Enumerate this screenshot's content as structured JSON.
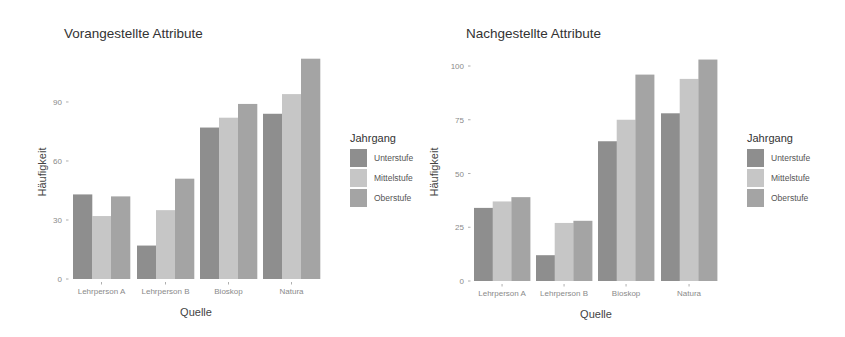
{
  "chart_data": [
    {
      "type": "bar",
      "title": "Vorangestellte Attribute",
      "xlabel": "Quelle",
      "ylabel": "Häufigkeit",
      "categories": [
        "Lehrperson A",
        "Lehrperson B",
        "Bioskop",
        "Natura"
      ],
      "series": [
        {
          "name": "Unterstufe",
          "values": [
            43,
            17,
            77,
            84
          ]
        },
        {
          "name": "Mittelstufe",
          "values": [
            32,
            35,
            82,
            94
          ]
        },
        {
          "name": "Oberstufe",
          "values": [
            42,
            51,
            89,
            112
          ]
        }
      ],
      "yticks": [
        0,
        30,
        60,
        90
      ],
      "ylim": [
        0,
        115
      ],
      "legend": {
        "title": "Jahrgang",
        "position": "right"
      },
      "grid": false
    },
    {
      "type": "bar",
      "title": "Nachgestellte Attribute",
      "xlabel": "Quelle",
      "ylabel": "Häufigkeit",
      "categories": [
        "Lehrperson A",
        "Lehrperson B",
        "Bioskop",
        "Natura"
      ],
      "series": [
        {
          "name": "Unterstufe",
          "values": [
            34,
            12,
            65,
            78
          ]
        },
        {
          "name": "Mittelstufe",
          "values": [
            37,
            27,
            75,
            94
          ]
        },
        {
          "name": "Oberstufe",
          "values": [
            39,
            28,
            96,
            103
          ]
        }
      ],
      "yticks": [
        0,
        25,
        50,
        75,
        100
      ],
      "ylim": [
        0,
        105
      ],
      "legend": {
        "title": "Jahrgang",
        "position": "right"
      },
      "grid": false
    }
  ],
  "colors": {
    "Unterstufe": "#8e8e8e",
    "Mittelstufe": "#c6c6c6",
    "Oberstufe": "#a4a4a4"
  },
  "layout": [
    {
      "title_x": 64,
      "title_y": 38,
      "plot_left": 70,
      "plot_right": 324,
      "y0_px": 279,
      "px_per_unit": 1.967,
      "group_starts": [
        73,
        137,
        200,
        263
      ],
      "bar_width": 19,
      "ylabel_x": 46,
      "ylabel_y": 172,
      "xlabel_x": 196,
      "xlabel_y": 316,
      "tick_label_x": 62,
      "legend_x": 350,
      "legend_y": 147
    },
    {
      "title_x": 44,
      "title_y": 38,
      "plot_left": 50,
      "plot_right": 298,
      "y0_px": 281,
      "px_per_unit": 2.15,
      "group_starts": [
        52,
        114,
        176,
        239
      ],
      "bar_width": 18.7,
      "ylabel_x": 16,
      "ylabel_y": 172,
      "xlabel_x": 174,
      "xlabel_y": 318,
      "tick_label_x": 42,
      "legend_x": 325,
      "legend_y": 147
    }
  ]
}
